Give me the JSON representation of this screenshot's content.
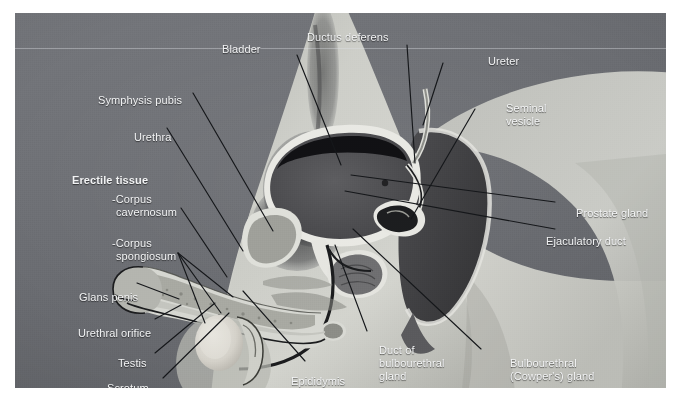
{
  "figure": {
    "background_color": "#6e7075",
    "label_color": "#f2f3f4",
    "leader_color": "#15171a",
    "body_fill": "#c8c9c4",
    "frame": {
      "x": 15,
      "y": 13,
      "width": 651,
      "height": 375
    }
  },
  "labels": {
    "bladder": "Bladder",
    "ductus_deferens": "Ductus deferens",
    "ureter": "Ureter",
    "seminal_vesicle_l1": "Seminal",
    "seminal_vesicle_l2": "vesicle",
    "symphysis_pubis": "Symphysis pubis",
    "urethra": "Urethra",
    "erectile_tissue": "Erectile tissue",
    "corpus_cavernosum_l1": "-Corpus",
    "corpus_cavernosum_l2": "cavernosum",
    "corpus_spongiosum_l1": "-Corpus",
    "corpus_spongiosum_l2": "spongiosum",
    "glans_penis": "Glans penis",
    "urethral_orifice": "Urethral orifice",
    "testis": "Testis",
    "scrotum": "Scrotum",
    "epididymis": "Epididymis",
    "duct_bulbourethral_l1": "Duct of",
    "duct_bulbourethral_l2": "bulbourethral",
    "duct_bulbourethral_l3": "gland",
    "bulbourethral_l1": "Bulbourethral",
    "bulbourethral_l2": "(Cowper's) gland",
    "prostate_gland": "Prostate gland",
    "ejaculatory_duct": "Ejaculatory duct"
  },
  "structures": [
    {
      "name": "bladder",
      "fill": "#4a4a4c"
    },
    {
      "name": "bladder-lumen",
      "fill": "#141416"
    },
    {
      "name": "prostate",
      "fill": "#6a6a6a"
    },
    {
      "name": "seminal-vesicle",
      "fill": "#474749"
    },
    {
      "name": "rectum",
      "fill": "#3a3a3c"
    },
    {
      "name": "testis",
      "fill": "#d6d2cb"
    },
    {
      "name": "epididymis",
      "fill": "#b9b5ad"
    },
    {
      "name": "penis-shaft",
      "fill": "#9c9a93"
    },
    {
      "name": "glans",
      "fill": "#8d8b85"
    },
    {
      "name": "pubic-hair",
      "fill": "#2e2f31"
    },
    {
      "name": "urethra-duct",
      "fill": "#111214"
    }
  ]
}
